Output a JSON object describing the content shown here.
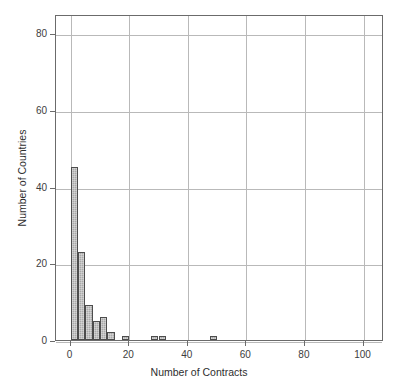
{
  "chart_data": {
    "type": "bar",
    "title": "",
    "subtitle": "",
    "xlabel": "Number of Contracts",
    "ylabel": "Number of Countries",
    "xlim": [
      -5,
      107
    ],
    "ylim": [
      0,
      85
    ],
    "xticks": [
      0,
      20,
      40,
      60,
      80,
      100
    ],
    "xticklabels": [
      "0",
      "20",
      "40",
      "60",
      "80",
      "100"
    ],
    "yticks": [
      0,
      20,
      40,
      60,
      80
    ],
    "yticklabels": [
      "0",
      "20",
      "40",
      "60",
      "80"
    ],
    "grid": true,
    "legend": null,
    "bin_width": 2.5,
    "bins": [
      {
        "x0": 0.0,
        "x1": 2.5,
        "value": 45
      },
      {
        "x0": 2.5,
        "x1": 5.0,
        "value": 23
      },
      {
        "x0": 5.0,
        "x1": 7.5,
        "value": 9
      },
      {
        "x0": 7.5,
        "x1": 10.0,
        "value": 5
      },
      {
        "x0": 10.0,
        "x1": 12.5,
        "value": 6
      },
      {
        "x0": 12.5,
        "x1": 15.0,
        "value": 2
      },
      {
        "x0": 17.5,
        "x1": 20.0,
        "value": 1
      },
      {
        "x0": 27.5,
        "x1": 30.0,
        "value": 1
      },
      {
        "x0": 30.0,
        "x1": 32.5,
        "value": 1
      },
      {
        "x0": 47.5,
        "x1": 50.0,
        "value": 1
      }
    ],
    "bar_fill_color": "#a9a9a9",
    "bar_edge_color": "#4d4d4d",
    "grid_color": "#b9b9b9",
    "axis_color": "#6b6b6b",
    "background_color": "#ffffff"
  }
}
